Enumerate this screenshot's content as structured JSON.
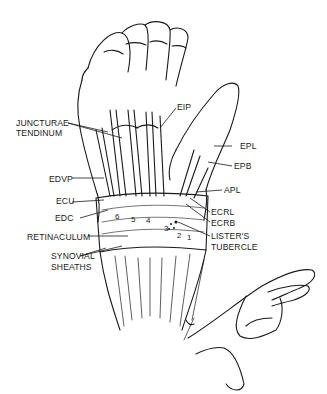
{
  "figure": {
    "labels": {
      "eip": "EIP",
      "juncturae_line1": "JUNCTURAE",
      "juncturae_line2": "TENDINUM",
      "epl": "EPL",
      "epb": "EPB",
      "edvp": "EDVP",
      "apl": "APL",
      "ecu": "ECU",
      "ecrl": "ECRL",
      "edc": "EDC",
      "ecrb": "ECRB",
      "retinaculum": "RETINACULUM",
      "listers_line1": "LISTER'S",
      "listers_line2": "TUBERCLE",
      "synovial_line1": "SYNOVIAL",
      "synovial_line2": "SHEATHS"
    },
    "compartment_numbers": [
      "6",
      "5",
      "4",
      "3",
      "2",
      "1"
    ],
    "colors": {
      "ink": "#1a1a1a",
      "background": "#ffffff"
    }
  }
}
